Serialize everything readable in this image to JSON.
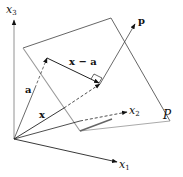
{
  "diagram": {
    "axes": {
      "x1": {
        "label": "x",
        "sub": "1"
      },
      "x2": {
        "label": "x",
        "sub": "2"
      },
      "x3": {
        "label": "x",
        "sub": "3"
      }
    },
    "vectors": {
      "a": "a",
      "x": "x",
      "x_minus_a": "x − a",
      "p": "p"
    },
    "plane": {
      "label": "P"
    },
    "colors": {
      "line": "#222222",
      "plane": "#666666"
    }
  }
}
